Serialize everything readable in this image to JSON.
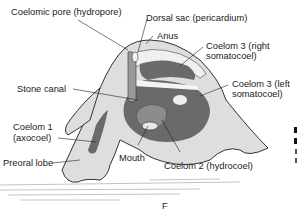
{
  "figure": {
    "panel_letter": "F",
    "labels": {
      "coelomic_pore": "Coelomic pore (hydropore)",
      "dorsal_sac": "Dorsal sac (pericardium)",
      "anus": "Anus",
      "coelom3_right_1": "Coelom 3 (right",
      "coelom3_right_2": "somatocoel)",
      "stone_canal": "Stone canal",
      "coelom3_left_1": "Coelom 3 (left",
      "coelom3_left_2": "somatocoel)",
      "coelom1_1": "Coelom 1",
      "coelom1_2": "(axocoel)",
      "preoral_lobe": "Preoral lobe",
      "mouth": "Mouth",
      "coelom2": "Coelom 2 (hydrocoel)"
    }
  },
  "colors": {
    "body_fill": "#dedede",
    "coelom_dark": "#6a6a6a",
    "coelom_mid": "#8c8c8c",
    "light_band": "#f0f0f0",
    "outline": "#333333",
    "substrate": "#bfbfbf"
  }
}
